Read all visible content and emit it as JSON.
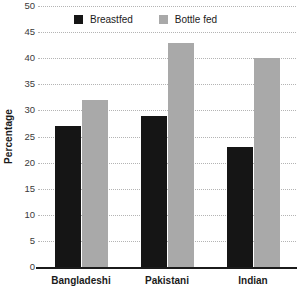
{
  "chart_data": {
    "type": "bar",
    "title": "",
    "subtitle": "",
    "xlabel": "",
    "ylabel": "Percentage",
    "categories": [
      "Bangladeshi",
      "Pakistani",
      "Indian"
    ],
    "series": [
      {
        "name": "Breastfed",
        "values": [
          27,
          29,
          23
        ],
        "color": "#151515"
      },
      {
        "name": "Bottle fed",
        "values": [
          32,
          43,
          40
        ],
        "color": "#a9a9a9"
      }
    ],
    "ylim": [
      0,
      50
    ],
    "ytick_step": 5,
    "yticks": [
      0,
      5,
      10,
      15,
      20,
      25,
      30,
      35,
      40,
      45,
      50
    ],
    "ytick_labels": [
      "0",
      "5",
      "10",
      "15",
      "20",
      "25",
      "30",
      "35",
      "40",
      "45",
      "50"
    ],
    "grid": true,
    "grid_style": "dotted",
    "grid_axis": "y",
    "legend_position": "top-center",
    "annotations": []
  },
  "legend": {
    "items": [
      {
        "label": "Breastfed",
        "swatch": "breastfed"
      },
      {
        "label": "Bottle fed",
        "swatch": "bottlefed"
      }
    ]
  },
  "colors": {
    "breastfed": "#151515",
    "bottle_fed": "#a9a9a9",
    "axis": "#1b1b1b",
    "gridline": "#b4b4b4",
    "background": "#ffffff"
  }
}
